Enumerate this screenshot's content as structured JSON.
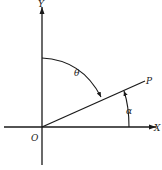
{
  "diagram": {
    "type": "polar-angle-figure",
    "axes": {
      "x_label": "X",
      "y_label": "Y",
      "origin_label": "O"
    },
    "ray": {
      "end_label": "P"
    },
    "angles": {
      "theta_label": "θ",
      "alpha_label": "α"
    },
    "colors": {
      "ink": "#1a1a1a",
      "background": "#ffffff"
    }
  }
}
